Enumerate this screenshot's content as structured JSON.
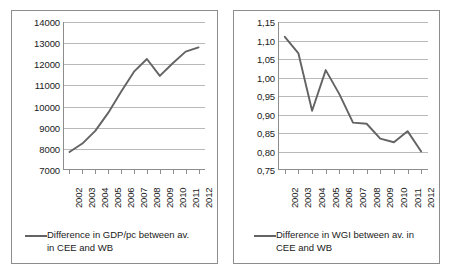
{
  "charts": [
    {
      "id": "gdp-chart",
      "legend_label": "Difference in GDP/pc between av. in CEE and WB",
      "chart_data": {
        "type": "line",
        "title": "",
        "xlabel": "",
        "ylabel": "",
        "grid": true,
        "legend_position": "bottom",
        "line_color": "#636363",
        "categories": [
          "2002",
          "2003",
          "2004",
          "2005",
          "2006",
          "2007",
          "2008",
          "2009",
          "2010",
          "2011",
          "2012"
        ],
        "x": [
          2002,
          2003,
          2004,
          2005,
          2006,
          2007,
          2008,
          2009,
          2010,
          2011,
          2012
        ],
        "values": [
          7850,
          8250,
          8850,
          9700,
          10700,
          11650,
          12250,
          11450,
          12050,
          12600,
          12800
        ],
        "ylim": [
          7000,
          14000
        ],
        "yticks": [
          7000,
          8000,
          9000,
          10000,
          11000,
          12000,
          13000,
          14000
        ],
        "ytick_labels": [
          "7000",
          "8000",
          "9000",
          "10000",
          "11000",
          "12000",
          "13000",
          "14000"
        ],
        "series": [
          {
            "name": "Difference in GDP/pc between av. in CEE and WB",
            "values": [
              7850,
              8250,
              8850,
              9700,
              10700,
              11650,
              12250,
              11450,
              12050,
              12600,
              12800
            ]
          }
        ]
      }
    },
    {
      "id": "wgi-chart",
      "legend_label": "Difference in WGI between av. in CEE and WB",
      "chart_data": {
        "type": "line",
        "title": "",
        "xlabel": "",
        "ylabel": "",
        "grid": true,
        "legend_position": "bottom",
        "line_color": "#636363",
        "categories": [
          "2002",
          "2003",
          "2004",
          "2005",
          "2006",
          "2007",
          "2008",
          "2009",
          "2010",
          "2011",
          "2012"
        ],
        "x": [
          2002,
          2003,
          2004,
          2005,
          2006,
          2007,
          2008,
          2009,
          2010,
          2011,
          2012
        ],
        "values": [
          1.11,
          1.065,
          0.91,
          1.02,
          0.955,
          0.878,
          0.875,
          0.835,
          0.825,
          0.855,
          0.8
        ],
        "ylim": [
          0.75,
          1.15
        ],
        "yticks": [
          0.75,
          0.8,
          0.85,
          0.9,
          0.95,
          1.0,
          1.05,
          1.1,
          1.15
        ],
        "ytick_labels": [
          "0,75",
          "0,80",
          "0,85",
          "0,90",
          "0,95",
          "1,00",
          "1,05",
          "1,10",
          "1,15"
        ],
        "series": [
          {
            "name": "Difference in WGI between av. in CEE and WB",
            "values": [
              1.11,
              1.065,
              0.91,
              1.02,
              0.955,
              0.878,
              0.875,
              0.835,
              0.825,
              0.855,
              0.8
            ]
          }
        ]
      }
    }
  ]
}
